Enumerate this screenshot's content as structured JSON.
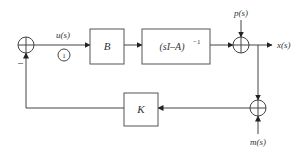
{
  "diagram": {
    "type": "block-diagram",
    "signals": {
      "u": "u(s)",
      "p": "p(s)",
      "x": "x(s)",
      "m": "m(s)"
    },
    "blocks": {
      "input_gain": "B",
      "plant": "(sI–A)",
      "plant_exp": "−1",
      "feedback_gain": "K"
    },
    "unit_circle_label": "1",
    "feedback_sign": "–",
    "colors": {
      "line": "#444444",
      "text": "#333333",
      "background": "#ffffff"
    }
  }
}
